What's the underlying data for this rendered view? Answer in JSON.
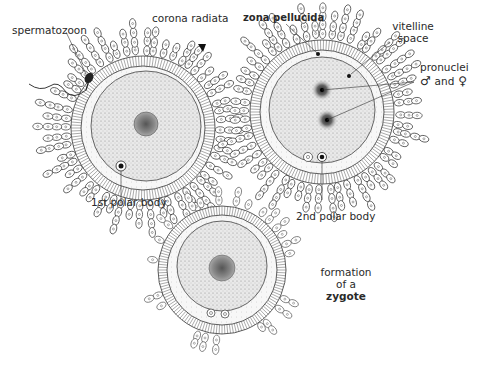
{
  "figure": {
    "cut_off_header": "(cropped caption text, illegible)",
    "cells": [
      {
        "id": "unfertilized-egg-with-sperm",
        "center": [
          143,
          128
        ]
      },
      {
        "id": "pronuclei-stage",
        "center": [
          322,
          112
        ]
      },
      {
        "id": "zygote",
        "center": [
          222,
          270
        ]
      }
    ]
  },
  "labels": {
    "spermatozoon": "spermatozoon",
    "corona_radiata": "corona radiata",
    "zona_pellucida": "zona pellucida",
    "vitelline_space_1": "vitelline",
    "vitelline_space_2": "space",
    "pronuclei": "pronuclei",
    "male_symbol": "♂",
    "and": "and",
    "female_symbol": "♀",
    "first_polar_body": "1st polar body",
    "second_polar_body": "2nd polar body",
    "formation_1": "formation",
    "formation_2": "of a",
    "zygote": "zygote"
  },
  "colors": {
    "ink": "#2a2a2a",
    "stipple": "#9a9a9a",
    "background": "#ffffff"
  }
}
